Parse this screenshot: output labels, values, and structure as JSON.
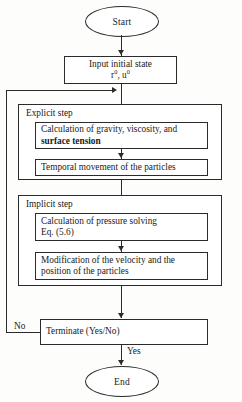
{
  "diagram": {
    "start_node": {
      "label": "Start"
    },
    "end_node": {
      "label": "End"
    },
    "input_node": {
      "line1": "Input initial state",
      "var1": "r",
      "var1_sup": "0",
      "separator": ", ",
      "var2": "u",
      "var2_sup": "0"
    },
    "explicit_group": {
      "label": "Explicit step",
      "steps": [
        {
          "line1": "Calculation of gravity, viscosity, and",
          "line2_bold": "surface tension"
        },
        {
          "line1": "Temporal movement of the particles"
        }
      ]
    },
    "implicit_group": {
      "label": "Implicit step",
      "steps": [
        {
          "line1": "Calculation of pressure solving",
          "line2": "Eq. (5.6)"
        },
        {
          "line1": "Modification of the velocity and the",
          "line2": "position of the particles"
        }
      ]
    },
    "decision_node": {
      "label": "Terminate (Yes/No)"
    },
    "edges": {
      "no_label": "No",
      "yes_label": "Yes"
    },
    "colors": {
      "stroke": "#2b2b2b",
      "background": "#fdfdfc",
      "text": "#1a1a1a"
    }
  }
}
